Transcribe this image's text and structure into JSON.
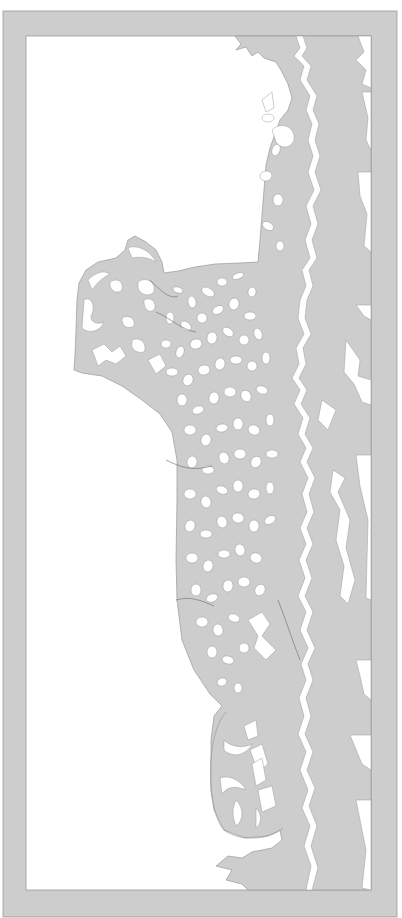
{
  "artwork": {
    "title": "Leopard lying on rocks – papercut stencil",
    "subject": "leopard",
    "style": "paper cut-out template",
    "width": 402,
    "height": 918
  },
  "colors": {
    "background": "#ffffff",
    "paper": "#cdcdcd",
    "paper_edge": "#9a9a9a",
    "cutout": "#ffffff"
  },
  "frame": {
    "outer": {
      "x": 3,
      "y": 11,
      "w": 394,
      "h": 906
    },
    "inner": {
      "x": 26,
      "y": 36,
      "w": 345,
      "h": 854
    }
  },
  "shapes": {
    "main_mass": "M235 36 L241 44 L236 50 L246 47 L252 56 L258 52 L264 58 L276 62 L282 72 L288 84 L292 98 L288 110 L280 120 L275 134 L270 148 L266 165 L264 190 L262 215 L260 240 L258 262 L240 263 L215 264 L195 267 L178 271 L164 273 L162 262 L156 250 L146 242 L135 236 L128 240 L125 250 L116 258 L98 262 L86 270 L79 283 L77 300 L76 330 L75 355 L74 370 L82 373 L102 376 L122 386 L142 400 L160 414 L172 432 L177 460 L177 500 L176 560 L177 600 L182 640 L194 670 L210 694 L222 706 L214 716 L211 740 L211 790 L214 810 L224 830 L245 838 L268 836 L280 830 L282 840 L272 848 L252 852 L242 858 L228 856 L216 866 L232 870 L226 880 L242 884 L248 890 L371 890 L371 36 Z",
    "tail_outline": "M226 712 C205 735 206 810 224 830 C240 842 270 840 283 828",
    "crack_main": "M296 36 L300 48 L294 56 L304 66 L300 80 L310 96 L306 110 L312 124 L308 140 L313 156 L308 172 L314 190 L306 206 L311 224 L305 240 L310 258 L302 270 L306 286 L300 300 L298 318 L304 334 L296 348 L299 364 L292 378 L300 390 L294 404 L303 418 L298 434 L306 448 L300 462 L308 478 L302 494 L307 512 L300 528 L306 544 L299 560 L305 578 L298 596 L306 612 L300 630 L308 648 L301 664 L306 680 L299 698 L304 716 L298 734 L306 752 L300 770 L308 790 L302 808 L310 826 L304 846 L311 866 L306 890 L312 890 L318 868 L311 846 L317 826 L309 806 L315 788 L307 770 L313 752 L305 734 L311 716 L306 698 L313 680 L308 664 L315 648 L307 630 L313 612 L305 596 L312 578 L306 560 L313 544 L307 528 L314 512 L309 494 L315 478 L307 462 L313 448 L305 434 L310 418 L301 404 L307 390 L299 378 L306 364 L303 348 L311 334 L305 318 L307 300 L313 286 L309 270 L317 258 L312 240 L318 224 L313 206 L321 190 L315 172 L320 156 L315 140 L319 124 L313 110 L317 96 L307 80 L311 66 L302 56 L307 48 L303 36 Z"
  },
  "edge_slivers": [
    "M358 36 L371 36 L371 88 L362 84 L366 70 L356 60 L364 52 Z",
    "M362 92 L371 92 L371 150 L366 140 L368 118 Z",
    "M358 172 L371 172 L371 252 L364 246 L367 214 L360 196 Z",
    "M356 305 L371 305 L371 320 L364 316 Z",
    "M346 340 L360 360 L358 376 L371 380 L371 405 L362 402 L354 384 L344 372 Z",
    "M356 455 L371 455 L371 600 L366 598 L368 520 L360 486 Z",
    "M356 660 L371 660 L371 700 L364 694 L360 676 Z",
    "M350 735 L371 735 L371 770 L362 764 Z",
    "M356 800 L371 800 L371 890 L362 888 L366 850 Z"
  ],
  "inner_cracks": [
    "M333 470 L345 478 L338 492 L350 520 L346 548 L355 580 L348 604 L340 596 L344 566 L336 540 L340 510 L330 492 Z",
    "M248 620 L262 612 L270 624 L262 636 L276 650 L266 660 L254 648 L258 636 Z",
    "M322 400 L336 410 L328 430 L318 420 Z",
    "M250 750 L262 744 L268 764 L258 772 Z",
    "M258 790 L272 786 L276 806 L262 812 Z"
  ],
  "tail_cutouts": [
    "M224 740 C232 748 244 748 252 744 C246 756 232 758 224 750 Z",
    "M220 778 C230 774 242 782 246 790 C236 786 228 786 222 794 Z",
    "M236 800 C244 808 244 820 236 826 C232 816 232 808 236 800 Z",
    "M252 764 L262 758 L266 780 L256 786 Z",
    "M256 808 C262 814 262 824 256 828 Z",
    "M244 726 L256 720 L258 736 L248 740 Z"
  ],
  "head_cutouts": [
    "M84 300 C90 296 96 304 92 314 C88 320 96 326 104 322 C100 332 88 334 82 328 Z",
    "M92 350 L104 344 L112 352 L120 346 L126 356 L116 364 L106 360 L98 366 Z",
    "M88 280 C96 272 104 270 110 274 C102 278 96 284 92 290 Z",
    "M110 282 C116 278 124 280 122 290 C118 294 112 292 110 286 Z",
    "M138 282 C146 276 156 282 154 292 C148 298 140 294 138 288 Z",
    "M128 248 C136 244 150 250 156 262 C150 258 140 256 132 258 Z",
    "M122 318 C128 314 136 318 134 326 C128 330 122 326 122 320 Z",
    "M144 300 C150 296 158 302 154 310 C148 314 144 308 144 302 Z",
    "M132 340 C140 336 148 344 144 352 C136 354 130 348 132 342 Z",
    "M148 360 L160 354 L166 366 L156 374 Z"
  ],
  "spots": [
    [
      178,
      290,
      5,
      3,
      20
    ],
    [
      192,
      302,
      4,
      6,
      -10
    ],
    [
      208,
      292,
      7,
      4,
      30
    ],
    [
      222,
      282,
      5,
      4,
      0
    ],
    [
      238,
      276,
      6,
      3,
      -20
    ],
    [
      252,
      292,
      4,
      5,
      10
    ],
    [
      170,
      318,
      4,
      6,
      0
    ],
    [
      186,
      326,
      6,
      4,
      40
    ],
    [
      202,
      318,
      5,
      5,
      0
    ],
    [
      218,
      310,
      6,
      4,
      -30
    ],
    [
      234,
      304,
      5,
      6,
      15
    ],
    [
      250,
      316,
      6,
      4,
      0
    ],
    [
      166,
      344,
      5,
      4,
      0
    ],
    [
      180,
      352,
      4,
      6,
      20
    ],
    [
      196,
      344,
      6,
      5,
      -15
    ],
    [
      212,
      338,
      5,
      6,
      10
    ],
    [
      228,
      332,
      6,
      4,
      35
    ],
    [
      244,
      340,
      5,
      5,
      0
    ],
    [
      258,
      334,
      4,
      6,
      -20
    ],
    [
      172,
      372,
      6,
      4,
      0
    ],
    [
      188,
      380,
      5,
      6,
      25
    ],
    [
      204,
      370,
      6,
      5,
      -10
    ],
    [
      220,
      364,
      5,
      6,
      15
    ],
    [
      236,
      360,
      6,
      4,
      0
    ],
    [
      252,
      366,
      5,
      5,
      30
    ],
    [
      266,
      358,
      4,
      6,
      0
    ],
    [
      182,
      400,
      5,
      6,
      0
    ],
    [
      198,
      410,
      6,
      4,
      -20
    ],
    [
      214,
      398,
      5,
      6,
      10
    ],
    [
      230,
      392,
      6,
      5,
      0
    ],
    [
      246,
      396,
      5,
      6,
      -30
    ],
    [
      262,
      390,
      6,
      4,
      20
    ],
    [
      190,
      430,
      6,
      5,
      0
    ],
    [
      206,
      440,
      5,
      6,
      15
    ],
    [
      222,
      428,
      6,
      4,
      -10
    ],
    [
      238,
      424,
      5,
      6,
      0
    ],
    [
      254,
      430,
      6,
      5,
      25
    ],
    [
      270,
      420,
      4,
      6,
      0
    ],
    [
      192,
      462,
      5,
      6,
      10
    ],
    [
      208,
      470,
      6,
      4,
      0
    ],
    [
      224,
      458,
      5,
      6,
      -20
    ],
    [
      240,
      454,
      6,
      5,
      0
    ],
    [
      256,
      462,
      5,
      6,
      30
    ],
    [
      272,
      454,
      6,
      4,
      0
    ],
    [
      190,
      494,
      6,
      5,
      0
    ],
    [
      206,
      502,
      5,
      6,
      -15
    ],
    [
      222,
      490,
      6,
      4,
      20
    ],
    [
      238,
      486,
      5,
      6,
      0
    ],
    [
      254,
      494,
      6,
      5,
      -10
    ],
    [
      270,
      488,
      4,
      6,
      0
    ],
    [
      190,
      526,
      5,
      6,
      20
    ],
    [
      206,
      534,
      6,
      4,
      0
    ],
    [
      222,
      522,
      5,
      6,
      -20
    ],
    [
      238,
      518,
      6,
      5,
      10
    ],
    [
      254,
      526,
      5,
      6,
      0
    ],
    [
      270,
      520,
      6,
      4,
      -30
    ],
    [
      192,
      558,
      6,
      5,
      0
    ],
    [
      208,
      566,
      5,
      6,
      15
    ],
    [
      224,
      554,
      6,
      4,
      0
    ],
    [
      240,
      550,
      5,
      6,
      -15
    ],
    [
      256,
      558,
      6,
      5,
      20
    ],
    [
      196,
      590,
      5,
      6,
      0
    ],
    [
      212,
      598,
      6,
      4,
      -20
    ],
    [
      228,
      586,
      5,
      6,
      10
    ],
    [
      244,
      582,
      6,
      5,
      0
    ],
    [
      260,
      590,
      5,
      6,
      30
    ],
    [
      202,
      622,
      6,
      5,
      0
    ],
    [
      218,
      630,
      5,
      6,
      -10
    ],
    [
      234,
      618,
      6,
      4,
      20
    ],
    [
      212,
      652,
      5,
      6,
      0
    ],
    [
      228,
      660,
      6,
      4,
      15
    ],
    [
      244,
      648,
      5,
      5,
      0
    ],
    [
      222,
      682,
      5,
      4,
      -20
    ],
    [
      238,
      688,
      4,
      5,
      0
    ],
    [
      268,
      118,
      6,
      4,
      0
    ],
    [
      276,
      150,
      4,
      6,
      20
    ],
    [
      266,
      176,
      6,
      5,
      -10
    ],
    [
      278,
      200,
      5,
      6,
      0
    ],
    [
      268,
      226,
      6,
      4,
      30
    ],
    [
      280,
      246,
      4,
      5,
      0
    ]
  ],
  "paw_cutouts": [
    "M272 130 C282 120 296 128 294 140 C290 150 280 148 276 142 Z",
    "M262 100 L272 92 L274 108 L266 112 Z"
  ],
  "contour_lines": [
    "M150 280 C160 290 170 300 178 296",
    "M156 312 C170 318 182 330 196 332",
    "M166 460 C186 470 196 470 212 466",
    "M176 600 C190 596 200 600 214 606",
    "M278 600 C286 620 292 640 300 660"
  ]
}
